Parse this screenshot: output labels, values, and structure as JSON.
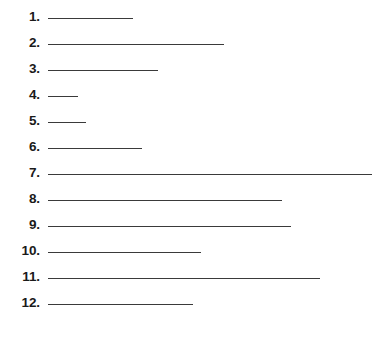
{
  "page": {
    "background_color": "#ffffff",
    "width": 382,
    "height": 352
  },
  "list": {
    "style": "numbered-blank-lines",
    "number_suffix": ".",
    "line_color": "#3a3a3a",
    "number_color": "#1a1a1a",
    "line_start_x": 48,
    "first_row_y": 10,
    "row_spacing": 26,
    "items": [
      {
        "number": "1.",
        "line_end_x": 133,
        "line_length": 85
      },
      {
        "number": "2.",
        "line_end_x": 224,
        "line_length": 176
      },
      {
        "number": "3.",
        "line_end_x": 158,
        "line_length": 110
      },
      {
        "number": "4.",
        "line_end_x": 78,
        "line_length": 30
      },
      {
        "number": "5.",
        "line_end_x": 86,
        "line_length": 38
      },
      {
        "number": "6.",
        "line_end_x": 142,
        "line_length": 94
      },
      {
        "number": "7.",
        "line_end_x": 372,
        "line_length": 324
      },
      {
        "number": "8.",
        "line_end_x": 282,
        "line_length": 234
      },
      {
        "number": "9.",
        "line_end_x": 291,
        "line_length": 243
      },
      {
        "number": "10.",
        "line_end_x": 201,
        "line_length": 153
      },
      {
        "number": "11.",
        "line_end_x": 320,
        "line_length": 272
      },
      {
        "number": "12.",
        "line_end_x": 193,
        "line_length": 145
      }
    ]
  }
}
